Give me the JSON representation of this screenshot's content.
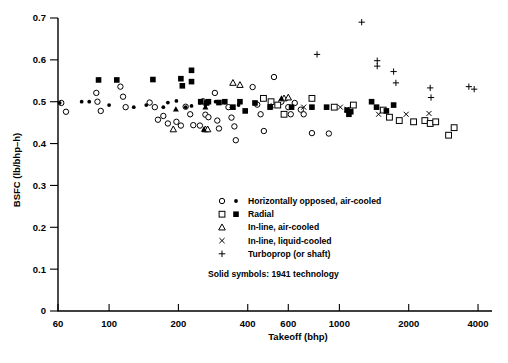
{
  "chart_data": {
    "type": "scatter",
    "title": "",
    "xlabel": "Takeoff (bhp)",
    "ylabel": "BSFC (lb/bhp–h)",
    "xscale": "log",
    "xlim": [
      60,
      4600
    ],
    "ylim": [
      0,
      0.7
    ],
    "xticks": [
      60,
      100,
      200,
      400,
      600,
      1000,
      2000,
      4000
    ],
    "xticklabels": [
      "60",
      "100",
      "200",
      "400",
      "600",
      "1000",
      "2000",
      "4000"
    ],
    "yticks": [
      0,
      0.1,
      0.2,
      0.3,
      0.4,
      0.5,
      0.6,
      0.7
    ],
    "yticklabels": [
      "0",
      "0.1",
      "0.2",
      "0.3",
      "0.4",
      "0.5",
      "0.6",
      "0.7"
    ],
    "grid": false,
    "legend_position": "lower-right-inside",
    "series": [
      {
        "name": "Horizontally opposed, air-cooled (open)",
        "marker": "circle-open",
        "filled": false,
        "points": [
          [
            62,
            0.497
          ],
          [
            65,
            0.476
          ],
          [
            88,
            0.521
          ],
          [
            89,
            0.5
          ],
          [
            92,
            0.478
          ],
          [
            112,
            0.536
          ],
          [
            115,
            0.512
          ],
          [
            118,
            0.487
          ],
          [
            150,
            0.498
          ],
          [
            158,
            0.487
          ],
          [
            163,
            0.457
          ],
          [
            172,
            0.466
          ],
          [
            180,
            0.448
          ],
          [
            196,
            0.452
          ],
          [
            205,
            0.443
          ],
          [
            215,
            0.488
          ],
          [
            225,
            0.47
          ],
          [
            232,
            0.444
          ],
          [
            248,
            0.443
          ],
          [
            256,
            0.501
          ],
          [
            262,
            0.469
          ],
          [
            270,
            0.463
          ],
          [
            288,
            0.521
          ],
          [
            295,
            0.455
          ],
          [
            300,
            0.436
          ],
          [
            330,
            0.487
          ],
          [
            340,
            0.462
          ],
          [
            350,
            0.441
          ],
          [
            355,
            0.408
          ],
          [
            420,
            0.535
          ],
          [
            440,
            0.493
          ],
          [
            455,
            0.47
          ],
          [
            470,
            0.43
          ],
          [
            520,
            0.559
          ],
          [
            560,
            0.5
          ],
          [
            600,
            0.487
          ],
          [
            615,
            0.47
          ],
          [
            640,
            0.497
          ],
          [
            680,
            0.481
          ],
          [
            700,
            0.47
          ],
          [
            760,
            0.425
          ],
          [
            900,
            0.424
          ]
        ]
      },
      {
        "name": "Horizontally opposed, air-cooled (solid, 1941 technology)",
        "marker": "circle-filled",
        "filled": true,
        "points": [
          [
            61,
            0.497
          ],
          [
            76,
            0.5
          ],
          [
            82,
            0.5
          ],
          [
            100,
            0.492
          ],
          [
            128,
            0.487
          ],
          [
            145,
            0.492
          ],
          [
            172,
            0.487
          ],
          [
            180,
            0.498
          ],
          [
            196,
            0.502
          ],
          [
            215,
            0.487
          ],
          [
            228,
            0.49
          ],
          [
            248,
            0.497
          ],
          [
            262,
            0.492
          ],
          [
            290,
            0.5
          ],
          [
            300,
            0.497
          ],
          [
            318,
            0.498
          ],
          [
            340,
            0.487
          ],
          [
            365,
            0.492
          ]
        ]
      },
      {
        "name": "Radial (open)",
        "marker": "square-open",
        "filled": false,
        "points": [
          [
            468,
            0.508
          ],
          [
            505,
            0.5
          ],
          [
            540,
            0.492
          ],
          [
            575,
            0.47
          ],
          [
            760,
            0.508
          ],
          [
            950,
            0.487
          ],
          [
            1150,
            0.492
          ],
          [
            1550,
            0.48
          ],
          [
            1650,
            0.463
          ],
          [
            1820,
            0.455
          ],
          [
            2100,
            0.452
          ],
          [
            2350,
            0.455
          ],
          [
            2480,
            0.448
          ],
          [
            2620,
            0.452
          ],
          [
            2980,
            0.42
          ],
          [
            3150,
            0.438
          ]
        ]
      },
      {
        "name": "Radial (solid, 1941 technology)",
        "marker": "square-filled",
        "filled": true,
        "points": [
          [
            90,
            0.552
          ],
          [
            108,
            0.552
          ],
          [
            155,
            0.553
          ],
          [
            205,
            0.555
          ],
          [
            208,
            0.538
          ],
          [
            228,
            0.575
          ],
          [
            228,
            0.548
          ],
          [
            250,
            0.5
          ],
          [
            265,
            0.497
          ],
          [
            270,
            0.5
          ],
          [
            300,
            0.498
          ],
          [
            318,
            0.5
          ],
          [
            345,
            0.487
          ],
          [
            370,
            0.5
          ],
          [
            390,
            0.478
          ],
          [
            430,
            0.497
          ],
          [
            500,
            0.487
          ],
          [
            620,
            0.487
          ],
          [
            760,
            0.487
          ],
          [
            880,
            0.487
          ],
          [
            1080,
            0.48
          ],
          [
            1100,
            0.47
          ],
          [
            1120,
            0.476
          ],
          [
            1380,
            0.5
          ],
          [
            1450,
            0.487
          ],
          [
            1600,
            0.478
          ],
          [
            1720,
            0.492
          ]
        ]
      },
      {
        "name": "In-line, air-cooled (open)",
        "marker": "triangle-open",
        "filled": false,
        "points": [
          [
            190,
            0.434
          ],
          [
            262,
            0.434
          ],
          [
            268,
            0.434
          ],
          [
            345,
            0.545
          ],
          [
            370,
            0.54
          ],
          [
            575,
            0.508
          ],
          [
            600,
            0.51
          ]
        ]
      },
      {
        "name": "In-line, air-cooled (solid, 1941 technology)",
        "marker": "triangle-filled",
        "filled": true,
        "points": [
          [
            195,
            0.482
          ],
          [
            258,
            0.434
          ],
          [
            262,
            0.487
          ],
          [
            505,
            0.49
          ],
          [
            560,
            0.508
          ]
        ]
      },
      {
        "name": "In-line, liquid-cooled",
        "marker": "cross-x",
        "filled": true,
        "points": [
          [
            700,
            0.487
          ],
          [
            1010,
            0.487
          ],
          [
            1080,
            0.482
          ],
          [
            1115,
            0.478
          ],
          [
            1480,
            0.47
          ],
          [
            1950,
            0.47
          ],
          [
            2450,
            0.472
          ]
        ]
      },
      {
        "name": "Turboprop (or shaft)",
        "marker": "plus",
        "filled": true,
        "points": [
          [
            800,
            0.613
          ],
          [
            1250,
            0.69
          ],
          [
            1460,
            0.598
          ],
          [
            1460,
            0.585
          ],
          [
            1720,
            0.572
          ],
          [
            1760,
            0.545
          ],
          [
            2480,
            0.533
          ],
          [
            2500,
            0.51
          ],
          [
            3650,
            0.536
          ],
          [
            3850,
            0.53
          ]
        ]
      }
    ]
  },
  "legend": {
    "entries": [
      {
        "label": "Horizontally opposed, air-cooled",
        "marker_open": "circle",
        "marker_solid": "circle"
      },
      {
        "label": "Radial",
        "marker_open": "square",
        "marker_solid": "square"
      },
      {
        "label": "In-line, air-cooled",
        "marker_open": "triangle",
        "marker_solid": ""
      },
      {
        "label": "In-line, liquid-cooled",
        "marker_open": "x",
        "marker_solid": ""
      },
      {
        "label": "Turboprop (or shaft)",
        "marker_open": "plus",
        "marker_solid": ""
      }
    ],
    "note": "Solid symbols:  1941 technology"
  },
  "colors": {
    "ink": "#000000",
    "paper": "#ffffff"
  }
}
